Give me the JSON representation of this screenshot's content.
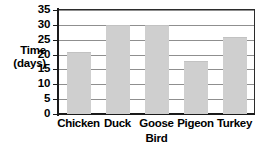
{
  "chart_data": {
    "type": "bar",
    "title": "",
    "categories": [
      "Chicken",
      "Duck",
      "Goose",
      "Pigeon",
      "Turkey"
    ],
    "values": [
      21,
      30,
      30,
      18,
      26
    ],
    "xlabel": "Bird",
    "ylabel": "Time (days)",
    "ylabel_lines": [
      "Time",
      "(days)"
    ],
    "ylim": [
      0,
      35
    ],
    "yticks": [
      0,
      5,
      10,
      15,
      20,
      25,
      30,
      35
    ],
    "ytick_labels": [
      "0",
      "5",
      "10",
      "15",
      "20",
      "25",
      "30",
      "35"
    ],
    "grid": true,
    "legend": false,
    "series": [
      {
        "name": "Time (days)",
        "values": [
          21,
          30,
          30,
          18,
          26
        ]
      }
    ]
  },
  "colors": {
    "bar_fill": "#cfcfcf",
    "axis": "#1a1a1a",
    "grid": "#8f8f8f",
    "background": "#ffffff",
    "text": "#000000"
  }
}
